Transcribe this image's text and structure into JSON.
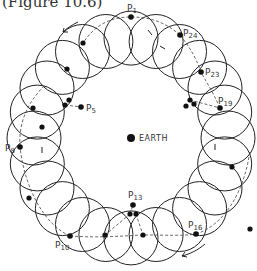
{
  "caption": "(Figure 10.6)",
  "center_label": "EARTH",
  "colors": {
    "stroke": "#222222",
    "text": "#333333",
    "background": "#ffffff"
  },
  "geometry": {
    "cx": 131,
    "cy": 138,
    "deferent_radius": 97,
    "epicycle_radius": 27,
    "epicycle_count": 24
  },
  "points": [
    {
      "id": "P1",
      "base": "P",
      "sub": "1",
      "x": 131,
      "y": 17,
      "lx": 127,
      "ly": 11
    },
    {
      "id": "P24",
      "base": "P",
      "sub": "24",
      "x": 180,
      "y": 35,
      "lx": 183,
      "ly": 36
    },
    {
      "id": "P23",
      "base": "P",
      "sub": "23",
      "x": 201,
      "y": 72,
      "lx": 205,
      "ly": 75
    },
    {
      "id": "P19",
      "base": "P",
      "sub": "19",
      "x": 220,
      "y": 108,
      "lx": 218,
      "ly": 104
    },
    {
      "id": "P5",
      "base": "P",
      "sub": "5",
      "x": 81,
      "y": 107,
      "lx": 86,
      "ly": 111
    },
    {
      "id": "P8",
      "base": "P",
      "sub": "8",
      "x": 20,
      "y": 147,
      "lx": 5,
      "ly": 151
    },
    {
      "id": "P13",
      "base": "P",
      "sub": "13",
      "x": 133,
      "y": 205,
      "lx": 128,
      "ly": 198
    },
    {
      "id": "P16",
      "base": "P",
      "sub": "16",
      "x": 196,
      "y": 234,
      "lx": 188,
      "ly": 228
    },
    {
      "id": "P10",
      "base": "P",
      "sub": "10",
      "x": 70,
      "y": 236,
      "lx": 55,
      "ly": 248
    }
  ],
  "extra_dots": [
    [
      83,
      43
    ],
    [
      67,
      69
    ],
    [
      65,
      105
    ],
    [
      69,
      100
    ],
    [
      42,
      127
    ],
    [
      29,
      198
    ],
    [
      105,
      235
    ],
    [
      143,
      235
    ],
    [
      130,
      214
    ],
    [
      136,
      214
    ],
    [
      190,
      100
    ],
    [
      194,
      104
    ],
    [
      186,
      106
    ],
    [
      232,
      167
    ],
    [
      250,
      229
    ],
    [
      33,
      108
    ]
  ]
}
